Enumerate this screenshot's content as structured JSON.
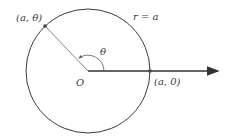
{
  "diagram": {
    "circle_label": "r = a",
    "point_theta_label": "(a, θ)",
    "point_zero_label": "(a, 0)",
    "angle_label": "θ",
    "origin_label": "O",
    "colors": {
      "stroke": "#3a3a3a",
      "radius_line": "#555555"
    }
  }
}
